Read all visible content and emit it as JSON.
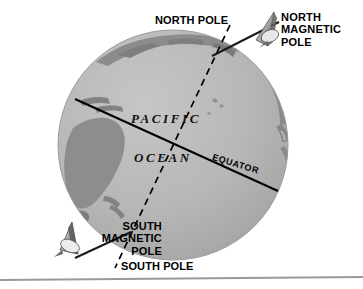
{
  "figure": {
    "background_color": "#ffffff",
    "ocean_color": "#b5b5b5",
    "land_color": "#8a8a8a",
    "line_color": "#000000",
    "border_color": "#9a9a9a"
  },
  "labels": {
    "north_pole": "NORTH POLE",
    "north_magnetic_pole": "NORTH\nMAGNETIC\nPOLE",
    "south_magnetic_pole": "SOUTH\nMAGNETIC\nPOLE",
    "south_pole": "SOUTH POLE",
    "pacific": "PACIFIC",
    "ocean": "OCEAN",
    "equator": "EQUATOR"
  },
  "icons": {
    "north_magnetic_arrow": "magnet-arrow-icon",
    "south_magnetic_arrow": "magnet-arrow-icon"
  },
  "geometry": {
    "globe_center_x": 173,
    "globe_center_y": 145,
    "globe_radius": 115,
    "equator_angle_deg": 17,
    "magnetic_axis_angle_deg": 12
  }
}
